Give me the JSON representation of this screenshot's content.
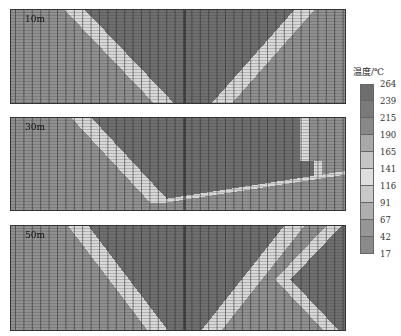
{
  "chart_data": {
    "type": "heatmap",
    "title": "",
    "panels": [
      {
        "label": "10m",
        "description": "V-shaped high-temperature region centered, light boundary band on both diagonals"
      },
      {
        "label": "30m",
        "description": "High-temperature region with bulge toward right edge, boundary band curving"
      },
      {
        "label": "50m",
        "description": "V-shaped high-temperature region plus second region at right edge"
      }
    ],
    "colorbar": {
      "title": "温度/℃",
      "ticks": [
        264,
        239,
        215,
        190,
        165,
        141,
        116,
        91,
        67,
        42,
        17
      ],
      "colors": [
        "#6e6e6e",
        "#7a7a7a",
        "#888888",
        "#a8a8a8",
        "#c4c4c4",
        "#dedede",
        "#c8c8c8",
        "#aeaeae",
        "#969696",
        "#8a8a8a",
        "#808080"
      ]
    }
  },
  "legend_title": "温度/℃",
  "panels": [
    {
      "label": "10m"
    },
    {
      "label": "30m"
    },
    {
      "label": "50m"
    }
  ]
}
